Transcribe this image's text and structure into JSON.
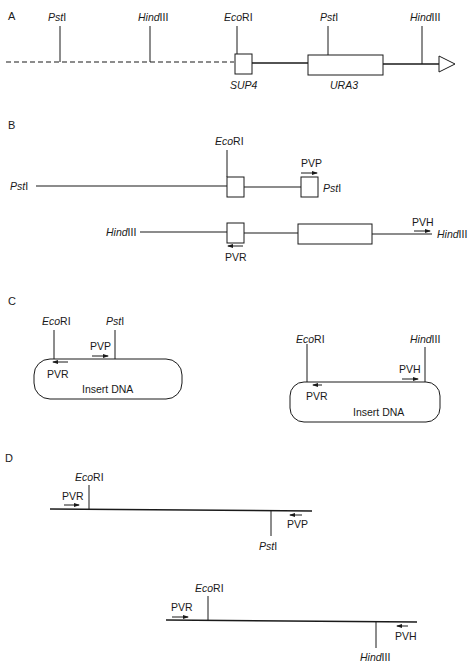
{
  "panels": {
    "A": {
      "label": "A",
      "sites": [
        {
          "name_italic": "Pst",
          "name_rest": "I"
        },
        {
          "name_italic": "Hind",
          "name_rest": "III"
        },
        {
          "name_italic": "Eco",
          "name_rest": "RI"
        },
        {
          "name_italic": "Pst",
          "name_rest": "I"
        },
        {
          "name_italic": "Hind",
          "name_rest": "III"
        }
      ],
      "genes": [
        "SUP4",
        "URA3"
      ]
    },
    "B": {
      "label": "B",
      "top": {
        "left_end": {
          "name_italic": "Pst",
          "name_rest": "I"
        },
        "site": {
          "name_italic": "Eco",
          "name_rest": "RI"
        },
        "primer": "PVP",
        "right_end": {
          "name_italic": "Pst",
          "name_rest": "I"
        }
      },
      "bottom": {
        "left_end": {
          "name_italic": "Hind",
          "name_rest": "III"
        },
        "primer_left": "PVR",
        "primer_right": "PVH",
        "right_end": {
          "name_italic": "Hind",
          "name_rest": "III"
        }
      }
    },
    "C": {
      "label": "C",
      "left": {
        "site1": {
          "name_italic": "Eco",
          "name_rest": "RI"
        },
        "site2": {
          "name_italic": "Pst",
          "name_rest": "I"
        },
        "primer1": "PVP",
        "primer2": "PVR",
        "insert": "Insert DNA"
      },
      "right": {
        "site1": {
          "name_italic": "Eco",
          "name_rest": "RI"
        },
        "site2": {
          "name_italic": "Hind",
          "name_rest": "III"
        },
        "primer1": "PVH",
        "primer2": "PVR",
        "insert": "Insert DNA"
      }
    },
    "D": {
      "label": "D",
      "top": {
        "primer_left": "PVR",
        "site_left": {
          "name_italic": "Eco",
          "name_rest": "RI"
        },
        "primer_right": "PVP",
        "site_right": {
          "name_italic": "Pst",
          "name_rest": "I"
        }
      },
      "bottom": {
        "primer_left": "PVR",
        "site_left": {
          "name_italic": "Eco",
          "name_rest": "RI"
        },
        "primer_right": "PVH",
        "site_right": {
          "name_italic": "Hind",
          "name_rest": "III"
        }
      }
    }
  }
}
